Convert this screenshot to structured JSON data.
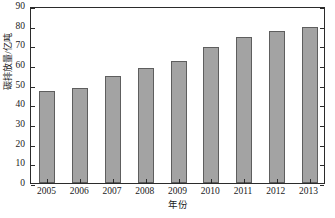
{
  "chart_data": {
    "type": "bar",
    "title": "",
    "subtitle": "",
    "xlabel": "年份",
    "ylabel": "碳排放量/亿吨",
    "categories": [
      "2005",
      "2006",
      "2007",
      "2008",
      "2009",
      "2010",
      "2011",
      "2012",
      "2013"
    ],
    "values": [
      47,
      48.5,
      54.5,
      58.5,
      62,
      69,
      74,
      77.5,
      79.5
    ],
    "series": [
      {
        "name": "碳排放量",
        "values": [
          47,
          48.5,
          54.5,
          58.5,
          62,
          69,
          74,
          77.5,
          79.5
        ]
      }
    ],
    "ylim": [
      0,
      90
    ],
    "ytick_labels": [
      "0",
      "10",
      "20",
      "30",
      "40",
      "50",
      "60",
      "70",
      "80",
      "90"
    ],
    "ytick_values": [
      0,
      10,
      20,
      30,
      40,
      50,
      60,
      70,
      80,
      90
    ],
    "xtick_labels": [
      "2005",
      "2006",
      "2007",
      "2008",
      "2009",
      "2010",
      "2011",
      "2012",
      "2013"
    ],
    "grid": false,
    "legend": "none",
    "bar_color": "#a3a3a3",
    "bar_border_color": "#5e5e5e",
    "axis_color": "#2b2b2b",
    "background_color": "#ffffff",
    "annotations": []
  }
}
